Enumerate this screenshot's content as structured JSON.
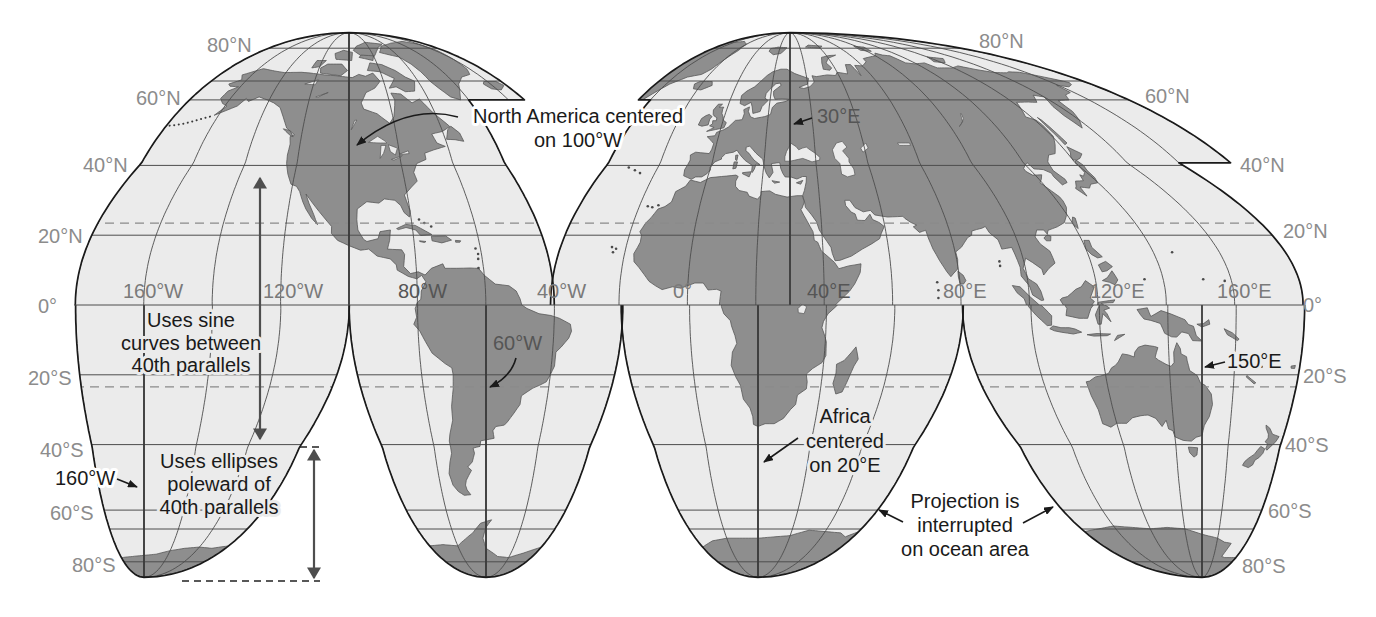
{
  "colors": {
    "background": "#ffffff",
    "ocean": "#ebebeb",
    "land": "#8e8e8e",
    "coast": "#585858",
    "lobe_outline": "#1a1a1a",
    "grid": "#4d4d4d",
    "central_meridian": "#3a3a3a",
    "tropic_dashed": "#8a8a8a",
    "latitude_label": "#8c8c8c",
    "longitude_label": "#7a7a7a",
    "annotation_text": "#1a1a1a"
  },
  "latitude_labels": {
    "left": [
      "80°N",
      "60°N",
      "40°N",
      "20°N",
      "0°",
      "20°S",
      "40°S",
      "60°S",
      "80°S"
    ],
    "right": [
      "80°N",
      "60°N",
      "40°N",
      "20°N",
      "0°",
      "20°S",
      "40°S",
      "60°S",
      "80°S"
    ]
  },
  "longitude_labels": [
    "160°W",
    "120°W",
    "80°W",
    "40°W",
    "0°",
    "40°E",
    "80°E",
    "120°E",
    "160°E"
  ],
  "annotations": {
    "north_america_center": [
      "North America centered",
      "on 100°W"
    ],
    "africa_center": [
      "Africa",
      "centered",
      "on 20°E"
    ],
    "sine_curves": [
      "Uses sine",
      "curves between",
      "40th parallels"
    ],
    "ellipses": [
      "Uses ellipses",
      "poleward of",
      "40th parallels"
    ],
    "interrupted": [
      "Projection is",
      "interrupted",
      "on ocean area"
    ],
    "meridian_callouts": {
      "e30": "30°E",
      "w60": "60°W",
      "e150": "150°E",
      "w160": "160°W"
    }
  },
  "projection": {
    "equator_y": 305,
    "rx": 196,
    "ry": 200,
    "homolographic_limit_deg": 40.7366,
    "parallels_deg": [
      20,
      40,
      60,
      66.56,
      80
    ],
    "tropics_deg": 23.44,
    "meridian_interval_deg": 20,
    "lobes": [
      {
        "id": "north-america-lobe",
        "hemisphere": "N",
        "central_meridian": -100,
        "x0": 349,
        "outline": [
          [
            -180,
            0
          ],
          [
            -180,
            90
          ],
          [
            -12,
            90
          ],
          [
            -12,
            60
          ],
          [
            -40,
            60
          ],
          [
            -40,
            0
          ]
        ]
      },
      {
        "id": "eurasia-lobe",
        "hemisphere": "N",
        "central_meridian": 30,
        "x0": 790,
        "outline": [
          [
            -40,
            0
          ],
          [
            -40,
            60
          ],
          [
            -46,
            60
          ],
          [
            -46,
            90
          ],
          [
            200,
            90
          ],
          [
            200,
            40.7366
          ],
          [
            180,
            40.7366
          ],
          [
            180,
            0
          ]
        ]
      },
      {
        "id": "south-pacific-lobe",
        "hemisphere": "S",
        "central_meridian": -160,
        "x0": 144,
        "outline": [
          [
            -180,
            0
          ],
          [
            -100,
            0
          ],
          [
            -100,
            -90
          ],
          [
            -180,
            -90
          ]
        ]
      },
      {
        "id": "south-america-lobe",
        "hemisphere": "S",
        "central_meridian": -60,
        "x0": 486,
        "outline": [
          [
            -100,
            0
          ],
          [
            -20,
            0
          ],
          [
            -20,
            -90
          ],
          [
            -100,
            -90
          ]
        ]
      },
      {
        "id": "africa-lobe",
        "hemisphere": "S",
        "central_meridian": 20,
        "x0": 758,
        "outline": [
          [
            -20,
            0
          ],
          [
            80,
            0
          ],
          [
            80,
            -90
          ],
          [
            -20,
            -90
          ]
        ]
      },
      {
        "id": "australia-lobe",
        "hemisphere": "S",
        "central_meridian": 150,
        "x0": 1202,
        "outline": [
          [
            80,
            0
          ],
          [
            180,
            0
          ],
          [
            180,
            -90
          ],
          [
            80,
            -90
          ]
        ]
      }
    ]
  }
}
